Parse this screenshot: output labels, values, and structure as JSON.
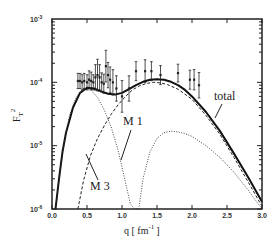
{
  "chart_data": {
    "type": "line",
    "title": "",
    "xlabel": "q [ fm -1 ]",
    "xlabel_parts": {
      "base": "q [ fm",
      "sup": "-1",
      "close": "]"
    },
    "ylabel": "F_T^2",
    "ylabel_parts": {
      "base": "F",
      "sub": "T",
      "sup": "2"
    },
    "xlim": [
      0.0,
      3.0
    ],
    "ylim": [
      1e-06,
      0.001
    ],
    "yscale": "log",
    "grid": false,
    "legend": "inline annotations",
    "x_ticks": [
      "0.0",
      "0.5",
      "1.0",
      "1.5",
      "2.0",
      "2.5",
      "3.0"
    ],
    "y_ticks": [
      {
        "base": "10",
        "exp": "-3"
      },
      {
        "base": "10",
        "exp": "-4"
      },
      {
        "base": "10",
        "exp": "-5"
      },
      {
        "base": "10",
        "exp": "-6"
      }
    ],
    "annotations": {
      "total": "total",
      "m1": "M 1",
      "m3": "M 3"
    },
    "series": [
      {
        "name": "total",
        "style": "solid-thick",
        "x": [
          0.05,
          0.1,
          0.15,
          0.2,
          0.3,
          0.4,
          0.5,
          0.6,
          0.7,
          0.8,
          0.9,
          1.0,
          1.1,
          1.2,
          1.3,
          1.4,
          1.5,
          1.6,
          1.7,
          1.8,
          1.9,
          2.0,
          2.2,
          2.4,
          2.6,
          2.8,
          3.0
        ],
        "y": [
          1e-06,
          3e-06,
          8e-06,
          1.6e-05,
          4e-05,
          6.8e-05,
          8.2e-05,
          8e-05,
          7.2e-05,
          6.6e-05,
          6.4e-05,
          6.8e-05,
          7.8e-05,
          9e-05,
          0.000102,
          0.00011,
          0.000112,
          0.00011,
          0.000102,
          9e-05,
          7.6e-05,
          6e-05,
          3.4e-05,
          1.7e-05,
          7.5e-06,
          3.2e-06,
          1.3e-06
        ]
      },
      {
        "name": "M3",
        "style": "dashed",
        "x": [
          0.37,
          0.45,
          0.55,
          0.65,
          0.75,
          0.85,
          0.95,
          1.05,
          1.15,
          1.25,
          1.35,
          1.45,
          1.55,
          1.65,
          1.8,
          2.0,
          2.2,
          2.4,
          2.6,
          2.8,
          3.0
        ],
        "y": [
          1e-06,
          2.8e-06,
          7e-06,
          1.3e-05,
          2.1e-05,
          3.2e-05,
          4.5e-05,
          6e-05,
          7.6e-05,
          8.8e-05,
          9.6e-05,
          0.0001,
          9.8e-05,
          9.2e-05,
          7.8e-05,
          5.4e-05,
          3e-05,
          1.5e-05,
          6.5e-06,
          2.7e-06,
          1.1e-06
        ]
      },
      {
        "name": "M1",
        "style": "dotted",
        "x": [
          0.05,
          0.15,
          0.25,
          0.35,
          0.45,
          0.55,
          0.65,
          0.75,
          0.85,
          0.95,
          1.05,
          1.12,
          1.18,
          1.22
        ],
        "y": [
          1e-06,
          8e-06,
          3e-05,
          6e-05,
          7.8e-05,
          7.6e-05,
          5.8e-05,
          3.6e-05,
          1.9e-05,
          8e-06,
          2.6e-06,
          1.2e-06,
          1e-06,
          1e-06
        ]
      },
      {
        "name": "M1 (second lobe)",
        "style": "dotted",
        "x": [
          1.24,
          1.3,
          1.4,
          1.5,
          1.6,
          1.7,
          1.8,
          1.9,
          2.0,
          2.2,
          2.4,
          2.6,
          2.8,
          3.0
        ],
        "y": [
          1e-06,
          3e-06,
          8e-06,
          1.3e-05,
          1.6e-05,
          1.7e-05,
          1.65e-05,
          1.55e-05,
          1.4e-05,
          1e-05,
          6.5e-06,
          3.8e-06,
          2e-06,
          1e-06
        ]
      },
      {
        "name": "data",
        "style": "points-errorbars",
        "x": [
          0.37,
          0.4,
          0.43,
          0.46,
          0.5,
          0.53,
          0.56,
          0.59,
          0.62,
          0.65,
          0.68,
          0.71,
          0.74,
          0.77,
          0.8,
          0.83,
          0.87,
          0.92,
          1.0,
          1.1,
          1.2,
          1.33,
          1.42,
          1.55,
          1.8,
          1.97,
          2.03,
          2.1
        ],
        "y": [
          0.000105,
          0.000105,
          0.0001,
          0.000105,
          0.0001,
          0.00011,
          0.000105,
          0.0001,
          0.00012,
          0.00013,
          0.00012,
          0.0001,
          9.5e-05,
          0.00018,
          0.00013,
          0.00011,
          0.0001,
          8e-05,
          6e-05,
          8e-05,
          0.00015,
          0.00015,
          0.00015,
          0.00013,
          0.00014,
          0.00011,
          0.00011,
          9e-05
        ],
        "err": [
          0.12,
          0.12,
          0.12,
          0.12,
          0.12,
          0.14,
          0.14,
          0.12,
          0.2,
          0.25,
          0.2,
          0.15,
          0.15,
          0.25,
          0.2,
          0.2,
          0.2,
          0.2,
          0.25,
          0.2,
          0.15,
          0.18,
          0.15,
          0.15,
          0.14,
          0.15,
          0.16,
          0.2
        ]
      }
    ]
  }
}
